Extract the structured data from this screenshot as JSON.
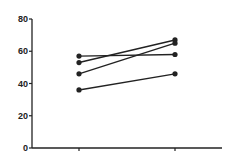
{
  "chart_data": {
    "type": "line",
    "title": "",
    "xlabel": "",
    "ylabel": "",
    "categories": [
      "",
      ""
    ],
    "ylim": [
      0,
      80
    ],
    "yticks": [
      0,
      20,
      40,
      60,
      80
    ],
    "ytick_labels": [
      "0",
      "20",
      "40",
      "60",
      "80"
    ],
    "grid": false,
    "legend": null,
    "series": [
      {
        "name": "subject-1",
        "values": [
          57,
          58
        ]
      },
      {
        "name": "subject-2",
        "values": [
          53,
          67
        ]
      },
      {
        "name": "subject-3",
        "values": [
          46,
          65
        ]
      },
      {
        "name": "subject-4",
        "values": [
          36,
          46
        ]
      }
    ],
    "colors": {
      "line": "#222222",
      "marker": "#222222",
      "axis": "#222222"
    }
  }
}
